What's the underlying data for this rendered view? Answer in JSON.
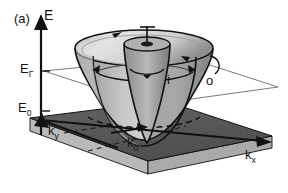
{
  "figure": {
    "panel_label": "(a)",
    "type": "3d-band-structure-diagram",
    "background_color": "#ffffff",
    "ink_color": "#111111"
  },
  "axes": {
    "energy_axis_label": "E",
    "kx_axis_label": "k",
    "kx_axis_sub": "x",
    "ky_axis_label": "k",
    "ky_axis_sub": "y"
  },
  "energy_levels": [
    {
      "symbol": "E",
      "sub": "Γ",
      "name": "E-Gamma"
    },
    {
      "symbol": "E",
      "sub": "0",
      "name": "E-zero"
    }
  ],
  "markers": {
    "k0_label": "k",
    "k0_sub": "0",
    "inner_branch_label": "i",
    "outer_branch_label": "o"
  },
  "colors": {
    "base_slab_top": "#595959",
    "base_slab_side": "#a8a8a8",
    "base_slab_front": "#bdbdbd",
    "cone_light": "#d8d8d8",
    "cone_mid": "#b4b4b4",
    "cone_dark": "#8e8e8e",
    "cone_darkest": "#6e6e6e",
    "fermi_plane": "#ffffff",
    "outline": "#111111",
    "thin_line": "#6b6b6b"
  }
}
